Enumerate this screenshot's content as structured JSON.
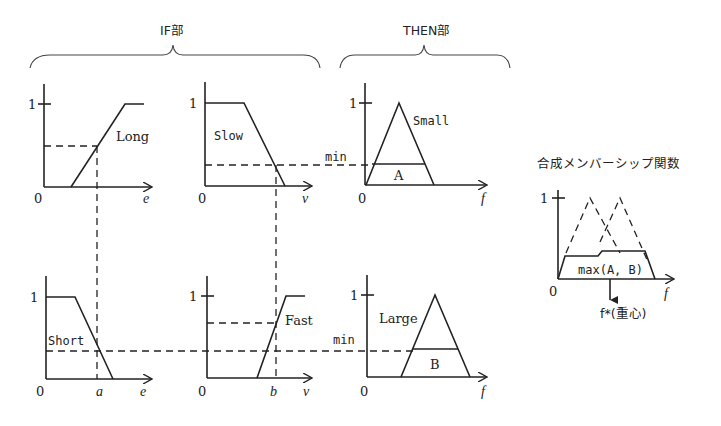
{
  "headers": {
    "if_part": "IF部",
    "then_part": "THEN部",
    "composite_title": "合成メンバーシップ関数"
  },
  "panels": {
    "long": {
      "label": "Long",
      "axis_var": "e",
      "one": "1",
      "zero": "0"
    },
    "slow": {
      "label": "Slow",
      "axis_var": "v",
      "one": "1",
      "zero": "0"
    },
    "small": {
      "label": "Small",
      "axis_var": "f",
      "one": "1",
      "zero": "0",
      "region": "A",
      "min_label": "min"
    },
    "short": {
      "label": "Short",
      "axis_var": "e",
      "one": "1",
      "zero": "0",
      "input_mark": "a"
    },
    "fast": {
      "label": "Fast",
      "axis_var": "v",
      "one": "1",
      "zero": "0",
      "input_mark": "b"
    },
    "large": {
      "label": "Large",
      "axis_var": "f",
      "one": "1",
      "zero": "0",
      "region": "B",
      "min_label": "min"
    },
    "composite": {
      "one": "1",
      "zero": "0",
      "axis_var": "f",
      "region": "max(A, B)",
      "centroid": "f*(重心)"
    }
  }
}
